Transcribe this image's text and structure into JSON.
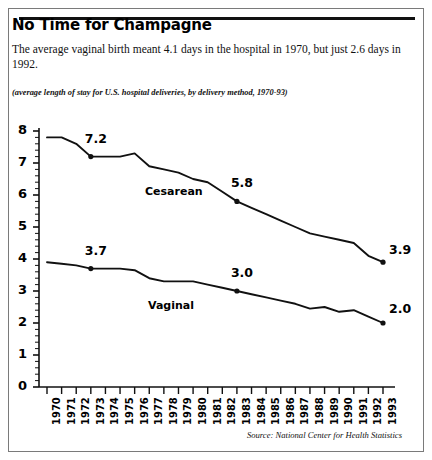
{
  "headline": "No Time for Champagne",
  "deck": "The average vaginal birth meant 4.1 days in the hospital in 1970, but just 2.6 days in 1992.",
  "subnote": "(average length of stay for U.S. hospital deliveries, by delivery method, 1970-93)",
  "source": "Source: National Center for Health Statistics",
  "colors": {
    "line": "#111111",
    "text": "#000000",
    "axis": "#111111",
    "border": "#7a7a7a",
    "background": "#ffffff"
  },
  "chart_data": {
    "type": "line",
    "title": "No Time for Champagne",
    "subtitle": "(average length of stay for U.S. hospital deliveries, by delivery method, 1970-93)",
    "xlabel": "",
    "ylabel": "",
    "xlim": [
      1970,
      1993
    ],
    "ylim": [
      0,
      8
    ],
    "yticks": [
      0,
      1,
      2,
      3,
      4,
      5,
      6,
      7,
      8
    ],
    "ytick_labels": [
      "0",
      "1",
      "2",
      "3",
      "4",
      "5",
      "6",
      "7",
      "8"
    ],
    "minor_ticks": true,
    "grid": false,
    "legend": "inline-labels",
    "x": [
      1970,
      1971,
      1972,
      1973,
      1974,
      1975,
      1976,
      1977,
      1978,
      1979,
      1980,
      1981,
      1982,
      1983,
      1984,
      1985,
      1986,
      1987,
      1988,
      1989,
      1990,
      1991,
      1992,
      1993
    ],
    "xtick_labels": [
      "1970",
      "1971",
      "1972",
      "1973",
      "1974",
      "1975",
      "1976",
      "1977",
      "1978",
      "1979",
      "1980",
      "1981",
      "1982",
      "1983",
      "1984",
      "1985",
      "1986",
      "1987",
      "1988",
      "1989",
      "1990",
      "1991",
      "1992",
      "1993"
    ],
    "series": [
      {
        "name": "Cesarean",
        "label": "Cesarean",
        "values": [
          7.8,
          7.8,
          7.6,
          7.2,
          7.2,
          7.2,
          7.3,
          6.9,
          6.8,
          6.7,
          6.5,
          6.4,
          6.1,
          5.8,
          5.6,
          5.4,
          5.2,
          5.0,
          4.8,
          4.7,
          4.6,
          4.5,
          4.1,
          3.9
        ]
      },
      {
        "name": "Vaginal",
        "label": "Vaginal",
        "values": [
          3.9,
          3.85,
          3.8,
          3.7,
          3.7,
          3.7,
          3.65,
          3.4,
          3.3,
          3.3,
          3.3,
          3.2,
          3.1,
          3.0,
          2.9,
          2.8,
          2.7,
          2.6,
          2.45,
          2.5,
          2.35,
          2.4,
          2.2,
          2.0
        ]
      }
    ],
    "annotations": [
      {
        "series": "Cesarean",
        "year": 1973,
        "value": 7.2,
        "text": "7.2"
      },
      {
        "series": "Cesarean",
        "year": 1983,
        "value": 5.8,
        "text": "5.8"
      },
      {
        "series": "Cesarean",
        "year": 1993,
        "value": 3.9,
        "text": "3.9"
      },
      {
        "series": "Vaginal",
        "year": 1973,
        "value": 3.7,
        "text": "3.7"
      },
      {
        "series": "Vaginal",
        "year": 1983,
        "value": 3.0,
        "text": "3.0"
      },
      {
        "series": "Vaginal",
        "year": 1993,
        "value": 2.0,
        "text": "2.0"
      }
    ]
  }
}
